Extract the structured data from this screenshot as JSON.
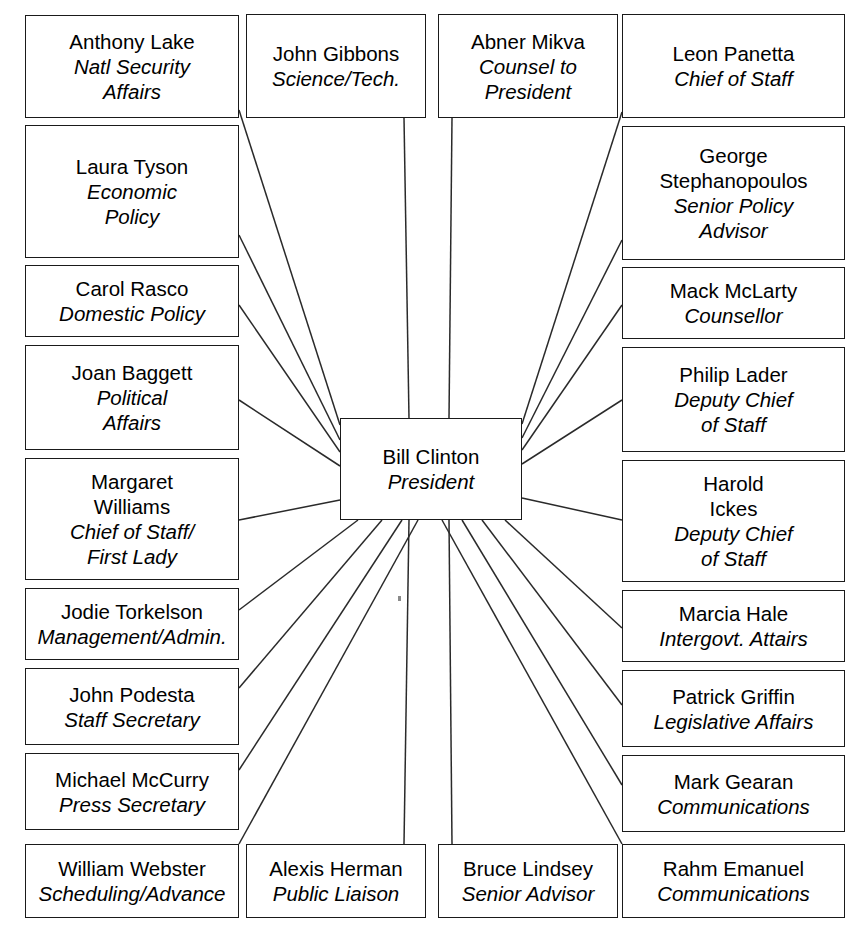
{
  "diagram": {
    "type": "radial-organization-chart",
    "title": "",
    "center": {
      "id": "center",
      "name": "Bill Clinton",
      "title": "President",
      "x": 340,
      "y": 418,
      "w": 182,
      "h": 102
    },
    "nodes": [
      {
        "id": "anthony-lake",
        "name": "Anthony Lake",
        "title": "Natl Security\nAffairs",
        "x": 25,
        "y": 15,
        "w": 214,
        "h": 103,
        "anchor": "right",
        "ax": 239,
        "ay": 110,
        "cx": 340,
        "cy": 425
      },
      {
        "id": "john-gibbons",
        "name": "John Gibbons",
        "title": "Science/Tech.",
        "x": 246,
        "y": 14,
        "w": 180,
        "h": 104,
        "anchor": "bottom",
        "ax": 404,
        "ay": 118,
        "cx": 409,
        "cy": 418
      },
      {
        "id": "abner-mikva",
        "name": "Abner Mikva",
        "title": "Counsel to\nPresident",
        "x": 438,
        "y": 14,
        "w": 180,
        "h": 104,
        "anchor": "bottom",
        "ax": 452,
        "ay": 118,
        "cx": 449,
        "cy": 418
      },
      {
        "id": "leon-panetta",
        "name": "Leon Panetta",
        "title": "Chief of Staff",
        "x": 622,
        "y": 14,
        "w": 223,
        "h": 104,
        "anchor": "left",
        "ax": 622,
        "ay": 112,
        "cx": 522,
        "cy": 424
      },
      {
        "id": "laura-tyson",
        "name": "Laura Tyson",
        "title": "Economic\nPolicy",
        "x": 25,
        "y": 125,
        "w": 214,
        "h": 133,
        "anchor": "right",
        "ax": 239,
        "ay": 235,
        "cx": 340,
        "cy": 440
      },
      {
        "id": "george-stephanopoulos",
        "name": "George\nStephanopoulos",
        "title": "Senior Policy\nAdvisor",
        "x": 622,
        "y": 126,
        "w": 223,
        "h": 134,
        "anchor": "left",
        "ax": 622,
        "ay": 240,
        "cx": 522,
        "cy": 438
      },
      {
        "id": "carol-rasco",
        "name": "Carol Rasco",
        "title": "Domestic Policy",
        "x": 25,
        "y": 265,
        "w": 214,
        "h": 72,
        "anchor": "right",
        "ax": 239,
        "ay": 305,
        "cx": 340,
        "cy": 452
      },
      {
        "id": "mack-mclarty",
        "name": "Mack McLarty",
        "title": "Counsellor",
        "x": 622,
        "y": 267,
        "w": 223,
        "h": 72,
        "anchor": "left",
        "ax": 622,
        "ay": 305,
        "cx": 522,
        "cy": 450
      },
      {
        "id": "joan-baggett",
        "name": "Joan Baggett",
        "title": "Political\nAffairs",
        "x": 25,
        "y": 345,
        "w": 214,
        "h": 105,
        "anchor": "right",
        "ax": 239,
        "ay": 400,
        "cx": 340,
        "cy": 466
      },
      {
        "id": "philip-lader",
        "name": "Philip Lader",
        "title": "Deputy Chief\nof Staff",
        "x": 622,
        "y": 347,
        "w": 223,
        "h": 105,
        "anchor": "left",
        "ax": 622,
        "ay": 400,
        "cx": 522,
        "cy": 464
      },
      {
        "id": "margaret-williams",
        "name": "Margaret\nWilliams",
        "title": "Chief of Staff/\nFirst Lady",
        "x": 25,
        "y": 458,
        "w": 214,
        "h": 122,
        "anchor": "right",
        "ax": 239,
        "ay": 520,
        "cx": 340,
        "cy": 500
      },
      {
        "id": "harold-ickes",
        "name": "Harold\nIckes",
        "title": "Deputy Chief\nof Staff",
        "x": 622,
        "y": 460,
        "w": 223,
        "h": 122,
        "anchor": "left",
        "ax": 622,
        "ay": 520,
        "cx": 522,
        "cy": 498
      },
      {
        "id": "jodie-torkelson",
        "name": "Jodie Torkelson",
        "title": "Management/Admin.",
        "x": 25,
        "y": 588,
        "w": 214,
        "h": 72,
        "anchor": "right",
        "ax": 239,
        "ay": 610,
        "cx": 358,
        "cy": 520
      },
      {
        "id": "marcia-hale",
        "name": "Marcia Hale",
        "title": "Intergovt. Attairs",
        "x": 622,
        "y": 590,
        "w": 223,
        "h": 72,
        "anchor": "left",
        "ax": 622,
        "ay": 628,
        "cx": 505,
        "cy": 520
      },
      {
        "id": "john-podesta",
        "name": "John Podesta",
        "title": "Staff Secretary",
        "x": 25,
        "y": 668,
        "w": 214,
        "h": 77,
        "anchor": "right",
        "ax": 239,
        "ay": 688,
        "cx": 382,
        "cy": 520
      },
      {
        "id": "patrick-griffin",
        "name": "Patrick Griffin",
        "title": "Legislative Affairs",
        "x": 622,
        "y": 670,
        "w": 223,
        "h": 77,
        "anchor": "left",
        "ax": 622,
        "ay": 705,
        "cx": 482,
        "cy": 520
      },
      {
        "id": "michael-mccurry",
        "name": "Michael McCurry",
        "title": "Press Secretary",
        "x": 25,
        "y": 753,
        "w": 214,
        "h": 77,
        "anchor": "right",
        "ax": 239,
        "ay": 770,
        "cx": 402,
        "cy": 520
      },
      {
        "id": "mark-gearan",
        "name": "Mark Gearan",
        "title": "Communications",
        "x": 622,
        "y": 755,
        "w": 223,
        "h": 77,
        "anchor": "left",
        "ax": 622,
        "ay": 785,
        "cx": 462,
        "cy": 520
      },
      {
        "id": "william-webster",
        "name": "William Webster",
        "title": "Scheduling/Advance",
        "x": 25,
        "y": 844,
        "w": 214,
        "h": 74,
        "anchor": "top",
        "ax": 239,
        "ay": 844,
        "cx": 418,
        "cy": 520
      },
      {
        "id": "alexis-herman",
        "name": "Alexis Herman",
        "title": "Public Liaison",
        "x": 246,
        "y": 844,
        "w": 180,
        "h": 74,
        "anchor": "top",
        "ax": 404,
        "ay": 844,
        "cx": 409,
        "cy": 520
      },
      {
        "id": "bruce-lindsey",
        "name": "Bruce Lindsey",
        "title": "Senior Advisor",
        "x": 438,
        "y": 844,
        "w": 180,
        "h": 74,
        "anchor": "top",
        "ax": 452,
        "ay": 844,
        "cx": 449,
        "cy": 520
      },
      {
        "id": "rahm-emanuel",
        "name": "Rahm Emanuel",
        "title": "Communications",
        "x": 622,
        "y": 844,
        "w": 223,
        "h": 74,
        "anchor": "top",
        "ax": 622,
        "ay": 844,
        "cx": 442,
        "cy": 520
      }
    ],
    "colors": {
      "stroke": "#1a1a1a",
      "connector": "#2a2a2a",
      "background": "#ffffff",
      "text": "#000000"
    }
  }
}
